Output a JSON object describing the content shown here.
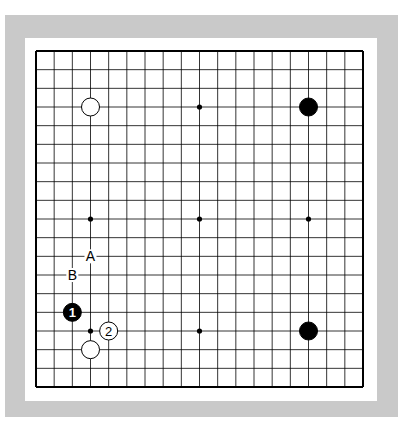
{
  "diagram": {
    "type": "go-board",
    "size": 19,
    "colors": {
      "frame": "#c9c9c9",
      "background": "#ffffff",
      "line": "#000000",
      "black_stone": "#000000",
      "white_stone": "#ffffff"
    },
    "star_points": [
      [
        9,
        3
      ],
      [
        3,
        9
      ],
      [
        9,
        9
      ],
      [
        15,
        9
      ],
      [
        3,
        15
      ],
      [
        9,
        15
      ]
    ],
    "stones": [
      {
        "color": "white",
        "col": 3,
        "row": 3,
        "label": ""
      },
      {
        "color": "black",
        "col": 15,
        "row": 3,
        "label": ""
      },
      {
        "color": "black",
        "col": 15,
        "row": 15,
        "label": ""
      },
      {
        "color": "white",
        "col": 3,
        "row": 16,
        "label": ""
      },
      {
        "color": "black",
        "col": 2,
        "row": 14,
        "label": "1"
      },
      {
        "color": "white",
        "col": 4,
        "row": 15,
        "label": "2"
      }
    ],
    "labels": [
      {
        "text": "A",
        "col": 3,
        "row": 11
      },
      {
        "text": "B",
        "col": 2,
        "row": 12
      }
    ]
  }
}
